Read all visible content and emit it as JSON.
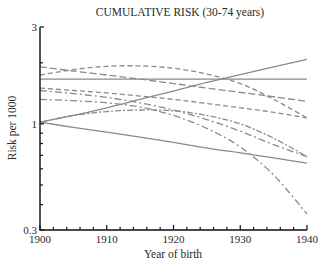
{
  "chart_data": {
    "type": "line",
    "title": "CUMULATIVE RISK (30-74 years)",
    "xlabel": "Year of birth",
    "ylabel": "Risk per 1000",
    "xlim": [
      1900,
      1940
    ],
    "ylim": [
      0.3,
      3
    ],
    "yscale": "log",
    "x_ticks": [
      1900,
      1910,
      1920,
      1930,
      1940
    ],
    "x_tick_labels": [
      "1900",
      "1910",
      "1920",
      "1930",
      "1940"
    ],
    "x_minor_step": 2,
    "y_tick_labels": [
      {
        "value": 3,
        "label": "3"
      },
      {
        "value": 1,
        "label": "1"
      },
      {
        "value": 0.3,
        "label": "0.3"
      }
    ],
    "y_minor_ticks": [
      2,
      0.9,
      0.8,
      0.7,
      0.6,
      0.5,
      0.4
    ],
    "grid": false,
    "legend": "none",
    "x": [
      1900,
      1905,
      1910,
      1915,
      1920,
      1925,
      1930,
      1935,
      1940
    ],
    "series": [
      {
        "name": "solid-rising",
        "style": "solid",
        "values": [
          1.02,
          1.1,
          1.2,
          1.32,
          1.45,
          1.6,
          1.75,
          1.91,
          2.08
        ]
      },
      {
        "name": "solid-flat",
        "style": "solid",
        "values": [
          1.66,
          1.66,
          1.66,
          1.66,
          1.66,
          1.66,
          1.66,
          1.66,
          1.66
        ]
      },
      {
        "name": "long-dash-descending",
        "style": "longdash",
        "values": [
          1.91,
          1.82,
          1.74,
          1.66,
          1.58,
          1.5,
          1.43,
          1.36,
          1.29
        ]
      },
      {
        "name": "dash-peaked",
        "style": "dash",
        "values": [
          1.74,
          1.85,
          1.92,
          1.93,
          1.88,
          1.76,
          1.58,
          1.32,
          1.07
        ]
      },
      {
        "name": "dash-descending",
        "style": "dash",
        "values": [
          1.5,
          1.46,
          1.42,
          1.37,
          1.32,
          1.26,
          1.2,
          1.14,
          1.07
        ]
      },
      {
        "name": "dash-dot-descending",
        "style": "dashdot",
        "values": [
          1.46,
          1.41,
          1.35,
          1.27,
          1.17,
          1.05,
          0.92,
          0.79,
          0.69
        ]
      },
      {
        "name": "dash-dot-long-curve",
        "style": "dashdot",
        "values": [
          1.32,
          1.3,
          1.27,
          1.21,
          1.1,
          0.95,
          0.77,
          0.56,
          0.36
        ]
      },
      {
        "name": "dot-dash-flat-curve",
        "style": "dotdash",
        "values": [
          1.02,
          1.1,
          1.15,
          1.17,
          1.16,
          1.1,
          1.0,
          0.85,
          0.69
        ]
      },
      {
        "name": "solid-descending",
        "style": "solid",
        "values": [
          1.02,
          0.96,
          0.91,
          0.86,
          0.81,
          0.76,
          0.72,
          0.68,
          0.64
        ]
      }
    ]
  }
}
